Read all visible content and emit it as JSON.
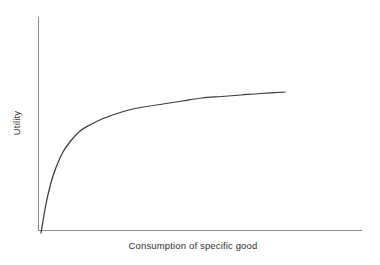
{
  "chart_data": {
    "type": "line",
    "title": "",
    "subtitle": "",
    "xlabel": "Consumption of specific good",
    "ylabel": "Utility",
    "grid": false,
    "legend": false,
    "legend_position": "none",
    "xticks": [],
    "yticks": [],
    "xlim": [
      0,
      100
    ],
    "ylim": [
      0,
      100
    ],
    "annotations": [],
    "series": [
      {
        "name": "Total utility",
        "shape": "concave-increasing",
        "x": [
          0,
          2,
          4,
          6,
          9,
          12,
          16,
          20,
          25,
          30,
          36,
          42,
          50,
          58,
          66,
          74,
          82,
          90,
          100
        ],
        "y": [
          0,
          19,
          33,
          43,
          54,
          61,
          68,
          72,
          76,
          79,
          82,
          84,
          86,
          88,
          90,
          91,
          92,
          93,
          94
        ]
      }
    ]
  },
  "figure": {
    "background_color": "#ffffff",
    "axis_color": "#8a8a8a",
    "curve_color": "#3a3a3a",
    "label_color": "#2f2f2f",
    "x_axis_label": "Consumption of specific good",
    "y_axis_label": "Utility"
  }
}
